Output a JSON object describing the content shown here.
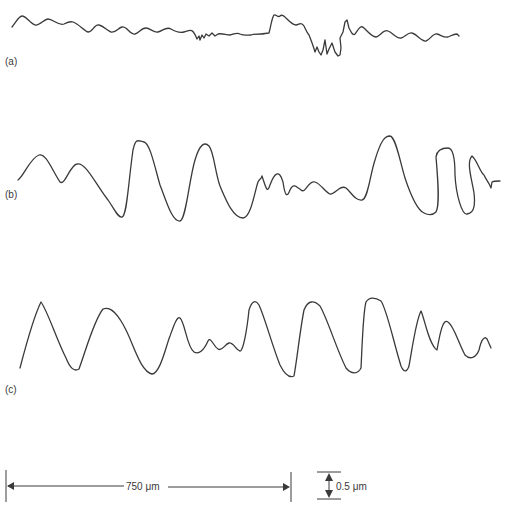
{
  "figure": {
    "panels": [
      {
        "id": "a",
        "label": "(a)",
        "description": "low-amplitude profile trace with disturbance near middle-right"
      },
      {
        "id": "b",
        "label": "(b)",
        "description": "large-amplitude irregular profile trace"
      },
      {
        "id": "c",
        "label": "(c)",
        "description": "large-amplitude profile trace"
      }
    ],
    "scale_bars": {
      "horizontal": {
        "label": "750 μm"
      },
      "vertical": {
        "label": "0.5 μm"
      }
    },
    "colors": {
      "ink": "#3a3a3a",
      "background": "#ffffff"
    }
  }
}
